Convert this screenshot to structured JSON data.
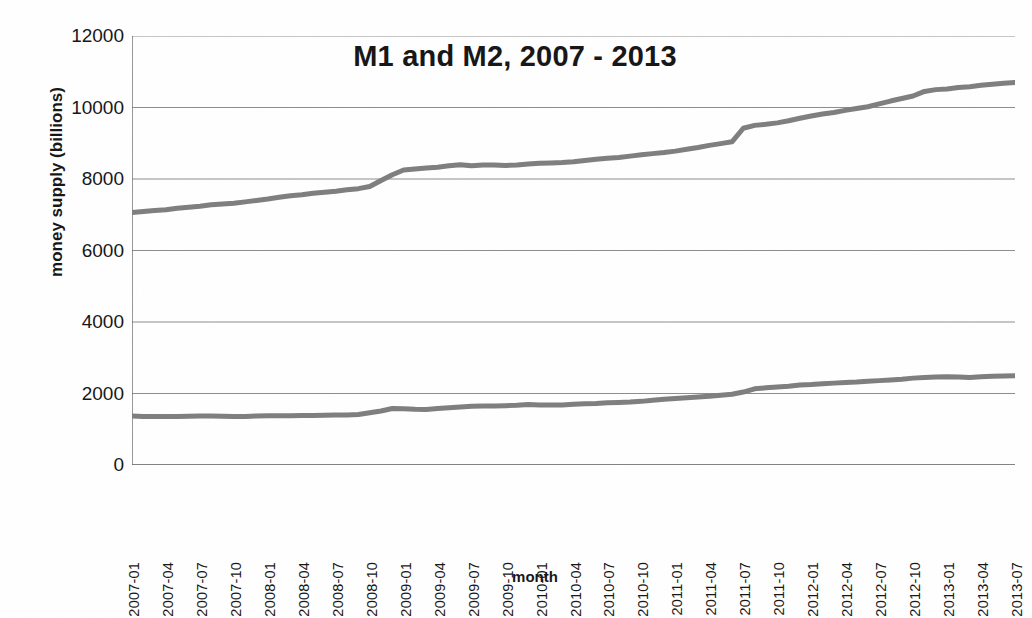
{
  "chart_data": {
    "type": "line",
    "title": "M1 and M2, 2007 - 2013",
    "xlabel": "month",
    "ylabel": "money supply (billions)",
    "ylim": [
      0,
      12000
    ],
    "ytick_values": [
      0,
      2000,
      4000,
      6000,
      8000,
      10000,
      12000
    ],
    "ytick_labels": [
      "0",
      "2000",
      "4000",
      "6000",
      "8000",
      "10000",
      "12000"
    ],
    "grid": "horizontal",
    "legend": "none",
    "line_color": "#7e7e7e",
    "x": [
      "2007-01",
      "2007-02",
      "2007-03",
      "2007-04",
      "2007-05",
      "2007-06",
      "2007-07",
      "2007-08",
      "2007-09",
      "2007-10",
      "2007-11",
      "2007-12",
      "2008-01",
      "2008-02",
      "2008-03",
      "2008-04",
      "2008-05",
      "2008-06",
      "2008-07",
      "2008-08",
      "2008-09",
      "2008-10",
      "2008-11",
      "2008-12",
      "2009-01",
      "2009-02",
      "2009-03",
      "2009-04",
      "2009-05",
      "2009-06",
      "2009-07",
      "2009-08",
      "2009-09",
      "2009-10",
      "2009-11",
      "2009-12",
      "2010-01",
      "2010-02",
      "2010-03",
      "2010-04",
      "2010-05",
      "2010-06",
      "2010-07",
      "2010-08",
      "2010-09",
      "2010-10",
      "2010-11",
      "2010-12",
      "2011-01",
      "2011-02",
      "2011-03",
      "2011-04",
      "2011-05",
      "2011-06",
      "2011-07",
      "2011-08",
      "2011-09",
      "2011-10",
      "2011-11",
      "2011-12",
      "2012-01",
      "2012-02",
      "2012-03",
      "2012-04",
      "2012-05",
      "2012-06",
      "2012-07",
      "2012-08",
      "2012-09",
      "2012-10",
      "2012-11",
      "2012-12",
      "2013-01",
      "2013-02",
      "2013-03",
      "2013-04",
      "2013-05",
      "2013-06",
      "2013-07"
    ],
    "xtick_labels": [
      "2007-01",
      "2007-04",
      "2007-07",
      "2007-10",
      "2008-01",
      "2008-04",
      "2008-07",
      "2008-10",
      "2009-01",
      "2009-04",
      "2009-07",
      "2009-10",
      "2010-01",
      "2010-04",
      "2010-07",
      "2010-10",
      "2011-01",
      "2011-04",
      "2011-07",
      "2011-10",
      "2012-01",
      "2012-04",
      "2012-07",
      "2012-10",
      "2013-01",
      "2013-04",
      "2013-07"
    ],
    "xtick_indices": [
      0,
      3,
      6,
      9,
      12,
      15,
      18,
      21,
      24,
      27,
      30,
      33,
      36,
      39,
      42,
      45,
      48,
      51,
      54,
      57,
      60,
      63,
      66,
      69,
      72,
      75,
      78
    ],
    "series": [
      {
        "name": "M2",
        "values": [
          7060,
          7090,
          7120,
          7140,
          7180,
          7210,
          7240,
          7280,
          7300,
          7320,
          7360,
          7400,
          7440,
          7490,
          7530,
          7560,
          7600,
          7630,
          7660,
          7700,
          7730,
          7790,
          7960,
          8120,
          8250,
          8280,
          8310,
          8330,
          8370,
          8400,
          8370,
          8390,
          8390,
          8380,
          8390,
          8420,
          8440,
          8450,
          8460,
          8480,
          8520,
          8550,
          8580,
          8600,
          8640,
          8680,
          8710,
          8740,
          8780,
          8830,
          8880,
          8940,
          8990,
          9040,
          9420,
          9500,
          9530,
          9570,
          9630,
          9700,
          9760,
          9820,
          9860,
          9920,
          9970,
          10020,
          10100,
          10180,
          10250,
          10320,
          10450,
          10500,
          10520,
          10560,
          10580,
          10620,
          10650,
          10680,
          10700
        ]
      },
      {
        "name": "M1",
        "values": [
          1370,
          1360,
          1355,
          1360,
          1355,
          1365,
          1370,
          1370,
          1365,
          1360,
          1360,
          1370,
          1375,
          1380,
          1380,
          1385,
          1385,
          1390,
          1400,
          1400,
          1410,
          1460,
          1510,
          1580,
          1575,
          1560,
          1555,
          1580,
          1600,
          1620,
          1640,
          1650,
          1650,
          1660,
          1670,
          1690,
          1680,
          1680,
          1680,
          1700,
          1710,
          1720,
          1740,
          1750,
          1760,
          1780,
          1810,
          1840,
          1860,
          1880,
          1900,
          1920,
          1950,
          1980,
          2040,
          2130,
          2160,
          2180,
          2200,
          2240,
          2250,
          2270,
          2290,
          2310,
          2320,
          2340,
          2360,
          2380,
          2400,
          2430,
          2450,
          2460,
          2470,
          2460,
          2450,
          2470,
          2480,
          2490,
          2500
        ]
      }
    ]
  },
  "axis": {
    "y_title": "money supply (billions)",
    "x_title": "month"
  }
}
